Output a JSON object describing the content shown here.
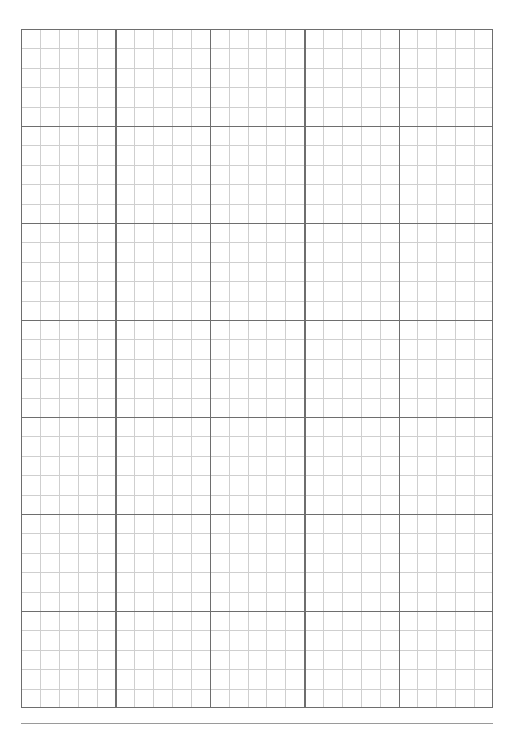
{
  "page": {
    "background_color": "#ffffff",
    "width_px": 515,
    "height_px": 734
  },
  "grid": {
    "name": "graph-paper-grid",
    "origin_x_px": 21,
    "origin_y_px": 29,
    "width_px": 472,
    "height_px": 679,
    "minor_columns": 25,
    "minor_rows": 35,
    "major_columns": 5,
    "major_rows": 7,
    "minor_cells_per_major": 5,
    "minor_cell_width_px": 18.88,
    "minor_cell_height_px": 19.4,
    "major_cell_width_px": 94.4,
    "major_cell_height_px": 97.0,
    "minor_line_color": "#cfcfcf",
    "major_line_color": "#6e6e6e",
    "border_color": "#6e6e6e",
    "minor_line_width_px": 1,
    "major_line_width_px": 1.4
  },
  "footer_rule": {
    "name": "footer-horizontal-rule",
    "x_px": 21,
    "y_px": 723,
    "width_px": 472,
    "color": "#9a9a9a",
    "thickness_px": 1
  },
  "chart_data": {
    "type": "table",
    "title": "",
    "xlabel": "",
    "ylabel": "",
    "categories": [],
    "values": [],
    "grid": true,
    "legend": "none"
  }
}
